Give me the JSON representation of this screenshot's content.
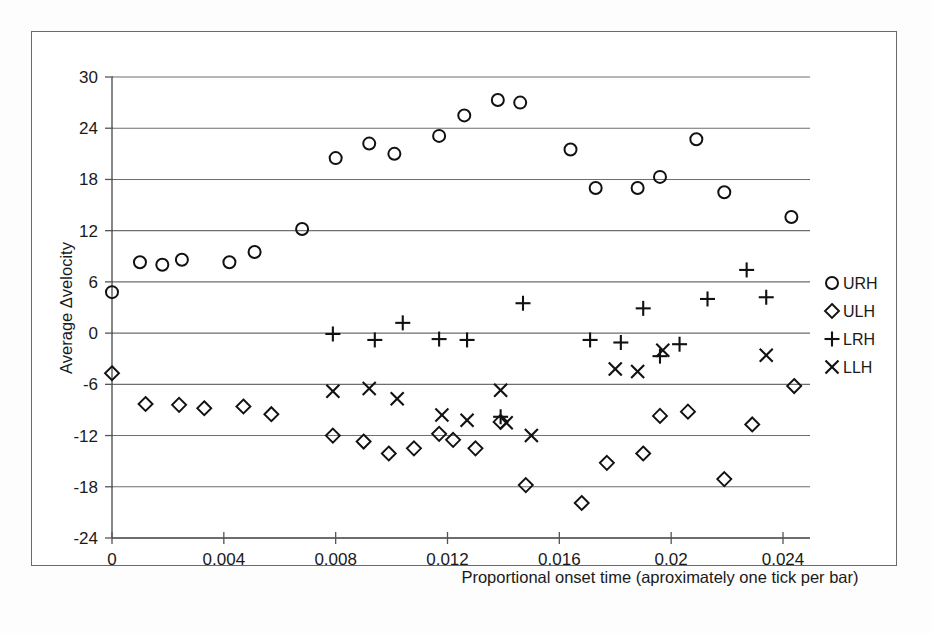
{
  "chart_data": {
    "type": "scatter",
    "title": "",
    "xlabel": "Proportional onset time (aproximately one tick per bar)",
    "ylabel": "Average Δvelocity",
    "xlim": [
      0,
      0.0248
    ],
    "ylim": [
      -24,
      30
    ],
    "xticks": [
      0,
      0.004,
      0.008,
      0.012,
      0.016,
      0.02,
      0.024
    ],
    "xticklabels": [
      "0",
      "0.004",
      "0.008",
      "0.012",
      "0.016",
      "0.02",
      "0.024"
    ],
    "yticks": [
      -24,
      -18,
      -12,
      -6,
      0,
      6,
      12,
      18,
      24,
      30
    ],
    "yticklabels": [
      "-24",
      "-18",
      "-12",
      "-6",
      "0",
      "6",
      "12",
      "18",
      "24",
      "30"
    ],
    "grid": "horizontal",
    "legend_position": "right",
    "series": [
      {
        "name": "URH",
        "marker": "circle",
        "points": [
          [
            0.0,
            4.8
          ],
          [
            0.001,
            8.3
          ],
          [
            0.0018,
            8.0
          ],
          [
            0.0025,
            8.6
          ],
          [
            0.0042,
            8.3
          ],
          [
            0.0051,
            9.5
          ],
          [
            0.0068,
            12.2
          ],
          [
            0.008,
            20.5
          ],
          [
            0.0092,
            22.2
          ],
          [
            0.0101,
            21.0
          ],
          [
            0.0117,
            23.1
          ],
          [
            0.0126,
            25.5
          ],
          [
            0.0138,
            27.3
          ],
          [
            0.0146,
            27.0
          ],
          [
            0.0164,
            21.5
          ],
          [
            0.0173,
            17.0
          ],
          [
            0.0188,
            17.0
          ],
          [
            0.0196,
            18.3
          ],
          [
            0.0209,
            22.7
          ],
          [
            0.0219,
            16.5
          ],
          [
            0.0243,
            13.6
          ]
        ]
      },
      {
        "name": "ULH",
        "marker": "diamond",
        "points": [
          [
            0.0,
            -4.7
          ],
          [
            0.0012,
            -8.3
          ],
          [
            0.0024,
            -8.4
          ],
          [
            0.0033,
            -8.8
          ],
          [
            0.0047,
            -8.6
          ],
          [
            0.0057,
            -9.5
          ],
          [
            0.0079,
            -12.0
          ],
          [
            0.009,
            -12.7
          ],
          [
            0.0099,
            -14.1
          ],
          [
            0.0108,
            -13.5
          ],
          [
            0.0117,
            -11.8
          ],
          [
            0.0122,
            -12.5
          ],
          [
            0.013,
            -13.5
          ],
          [
            0.0139,
            -10.4
          ],
          [
            0.0148,
            -17.8
          ],
          [
            0.0168,
            -19.9
          ],
          [
            0.0177,
            -15.2
          ],
          [
            0.019,
            -14.1
          ],
          [
            0.0196,
            -9.7
          ],
          [
            0.0206,
            -9.2
          ],
          [
            0.0219,
            -17.1
          ],
          [
            0.0229,
            -10.7
          ],
          [
            0.0244,
            -6.2
          ]
        ]
      },
      {
        "name": "LRH",
        "marker": "plus",
        "points": [
          [
            0.0079,
            -0.1
          ],
          [
            0.0094,
            -0.8
          ],
          [
            0.0104,
            1.2
          ],
          [
            0.0117,
            -0.7
          ],
          [
            0.0127,
            -0.8
          ],
          [
            0.0139,
            -9.8
          ],
          [
            0.0147,
            3.5
          ],
          [
            0.0171,
            -0.8
          ],
          [
            0.0182,
            -1.1
          ],
          [
            0.019,
            2.9
          ],
          [
            0.0196,
            -2.7
          ],
          [
            0.0203,
            -1.3
          ],
          [
            0.0213,
            4.0
          ],
          [
            0.0227,
            7.4
          ],
          [
            0.0234,
            4.2
          ]
        ]
      },
      {
        "name": "LLH",
        "marker": "ex",
        "points": [
          [
            0.0079,
            -6.8
          ],
          [
            0.0092,
            -6.5
          ],
          [
            0.0102,
            -7.7
          ],
          [
            0.0118,
            -9.6
          ],
          [
            0.0127,
            -10.2
          ],
          [
            0.0139,
            -6.7
          ],
          [
            0.0141,
            -10.5
          ],
          [
            0.015,
            -12.0
          ],
          [
            0.018,
            -4.2
          ],
          [
            0.0188,
            -4.5
          ],
          [
            0.0197,
            -2.0
          ],
          [
            0.0234,
            -2.6
          ]
        ]
      }
    ]
  },
  "legend": {
    "entries": [
      {
        "label": "URH",
        "marker": "circle"
      },
      {
        "label": "ULH",
        "marker": "diamond"
      },
      {
        "label": "LRH",
        "marker": "plus"
      },
      {
        "label": "LLH",
        "marker": "ex"
      }
    ]
  },
  "colors": {
    "marker": "#111111",
    "grid": "#6e6e6e",
    "axis": "#555555",
    "frame": "#6b6b6b",
    "background": "#ffffff"
  }
}
